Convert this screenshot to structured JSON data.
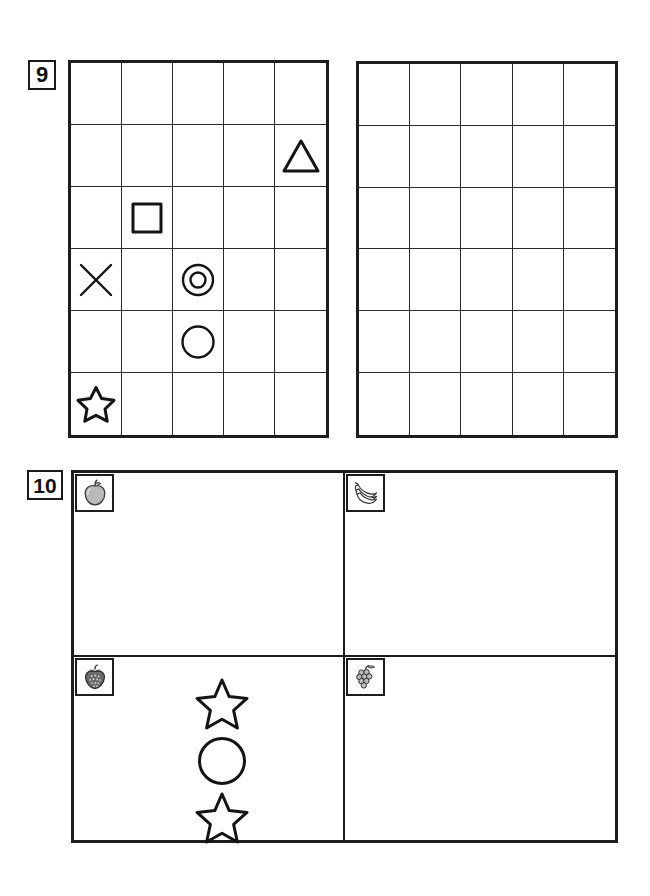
{
  "page": {
    "background_color": "#ffffff",
    "ink_color": "#1a1a1a"
  },
  "problems": [
    {
      "number": "9",
      "type": "grid-copy",
      "left_grid": {
        "columns": 5,
        "rows": 6,
        "label": "Model grid with shapes",
        "filled_cells": [
          {
            "row": 2,
            "col": 5,
            "shape": "triangle",
            "shape_label": "triangle"
          },
          {
            "row": 3,
            "col": 2,
            "shape": "square",
            "shape_label": "square"
          },
          {
            "row": 4,
            "col": 1,
            "shape": "cross",
            "shape_label": "x cross"
          },
          {
            "row": 4,
            "col": 3,
            "shape": "double-circle",
            "shape_label": "circle in circle"
          },
          {
            "row": 5,
            "col": 3,
            "shape": "circle",
            "shape_label": "circle"
          },
          {
            "row": 6,
            "col": 1,
            "shape": "star",
            "shape_label": "five point star"
          }
        ]
      },
      "right_grid": {
        "columns": 5,
        "rows": 6,
        "label": "Blank answer grid",
        "filled_cells": []
      }
    },
    {
      "number": "10",
      "type": "quadrant-copy",
      "quadrants": [
        {
          "position": "top-left",
          "fruit": "apple",
          "fruit_label": "apple",
          "shapes": []
        },
        {
          "position": "top-right",
          "fruit": "banana",
          "fruit_label": "bananas",
          "shapes": []
        },
        {
          "position": "bottom-left",
          "fruit": "strawberry",
          "fruit_label": "strawberry",
          "shapes": [
            "star",
            "circle",
            "star"
          ]
        },
        {
          "position": "bottom-right",
          "fruit": "grapes",
          "fruit_label": "grapes",
          "shapes": []
        }
      ]
    }
  ],
  "colors": {
    "ink": "#1a1a1a",
    "grid_line": "#2b2b2b",
    "fruit_fill": "#b8b8b8",
    "fruit_dark": "#4a4a4a"
  }
}
